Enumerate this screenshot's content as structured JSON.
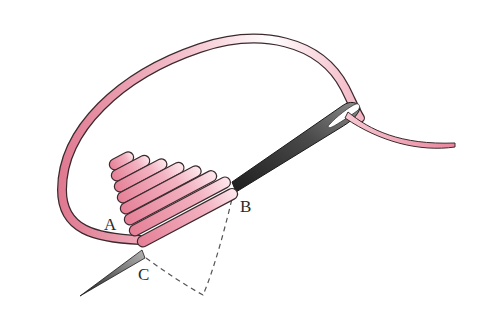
{
  "diagram": {
    "labels": {
      "a": "A",
      "b": "B",
      "c": "C"
    },
    "colors": {
      "thread_pink": "#e8879b",
      "thread_light": "#f7d5dd",
      "needle_dark": "#2b2b2b",
      "needle_light": "#9a9a9a",
      "outline": "#3a2a2e",
      "dashed_line": "#555555",
      "background": "#ffffff"
    },
    "stitch_count": 8
  }
}
